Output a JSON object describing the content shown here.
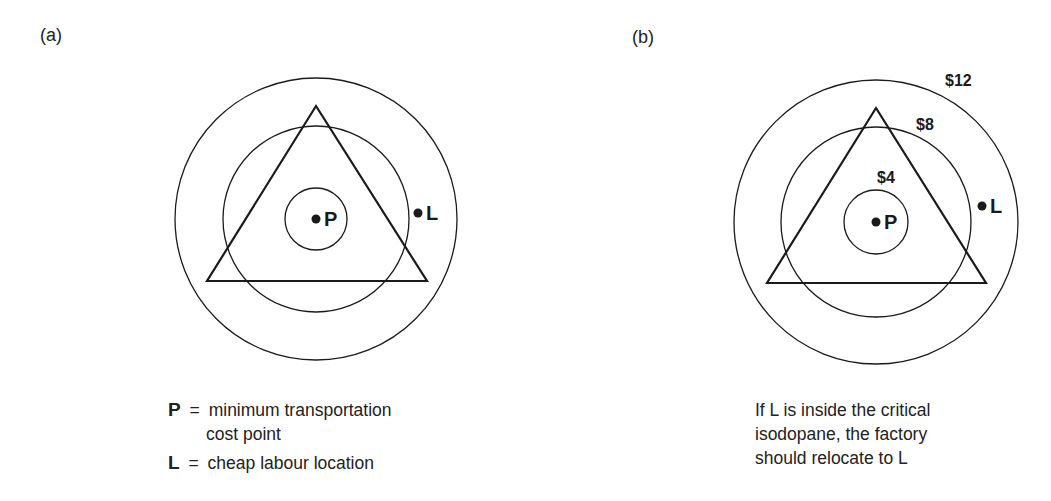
{
  "panels": [
    {
      "id": "a",
      "label": "(a)",
      "center": [
        316,
        219
      ],
      "circle_radii": [
        31,
        93,
        141
      ],
      "triangle": [
        [
          316,
          106
        ],
        [
          207,
          281
        ],
        [
          427,
          281
        ]
      ],
      "points": {
        "P": {
          "label": "P",
          "x": 316,
          "y": 219
        },
        "L": {
          "label": "L",
          "x": 418,
          "y": 213
        }
      },
      "isodopane_labels": [],
      "legend": [
        {
          "symbol": "P",
          "eq": "=",
          "text_line1": "minimum transportation",
          "text_line2": "cost point"
        },
        {
          "symbol": "L",
          "eq": "=",
          "text_line1": "cheap labour location"
        }
      ]
    },
    {
      "id": "b",
      "label": "(b)",
      "center": [
        876,
        222
      ],
      "circle_radii": [
        32,
        95,
        142
      ],
      "triangle": [
        [
          876,
          108
        ],
        [
          767,
          283
        ],
        [
          986,
          283
        ]
      ],
      "points": {
        "P": {
          "label": "P",
          "x": 876,
          "y": 222
        },
        "L": {
          "label": "L",
          "x": 982,
          "y": 206
        }
      },
      "isodopane_labels": [
        {
          "text": "$4",
          "x": 877,
          "y": 183
        },
        {
          "text": "$8",
          "x": 916,
          "y": 130
        },
        {
          "text": "$12",
          "x": 945,
          "y": 86
        }
      ],
      "caption": [
        "If L is inside the critical",
        "isodopane, the factory",
        "should relocate to L"
      ]
    }
  ],
  "colors": {
    "stroke": "#1a1a1a",
    "background": "#ffffff"
  }
}
